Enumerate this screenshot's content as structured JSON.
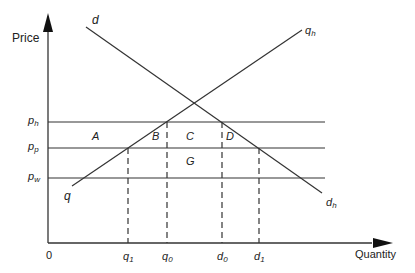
{
  "diagram": {
    "type": "supply-demand-price-regions",
    "axes": {
      "y_label": "Price",
      "x_label": "Quantity",
      "origin_label": "0"
    },
    "price_levels": [
      {
        "base": "p",
        "sub": "h",
        "y": 122
      },
      {
        "base": "p",
        "sub": "p",
        "y": 148
      },
      {
        "base": "p",
        "sub": "w",
        "y": 178
      }
    ],
    "quantity_marks": [
      {
        "base": "q",
        "sub": "1",
        "x": 128
      },
      {
        "base": "q",
        "sub": "0",
        "x": 167
      },
      {
        "base": "d",
        "sub": "0",
        "x": 222
      },
      {
        "base": "d",
        "sub": "1",
        "x": 259
      }
    ],
    "curves": {
      "supply": {
        "start_label": "q",
        "end_label_base": "q",
        "end_label_sub": "h"
      },
      "demand": {
        "start_label": "d",
        "end_label_base": "d",
        "end_label_sub": "h"
      }
    },
    "regions": [
      "A",
      "B",
      "C",
      "D",
      "G"
    ],
    "colors": {
      "line": "#333333",
      "background": "#ffffff"
    }
  }
}
